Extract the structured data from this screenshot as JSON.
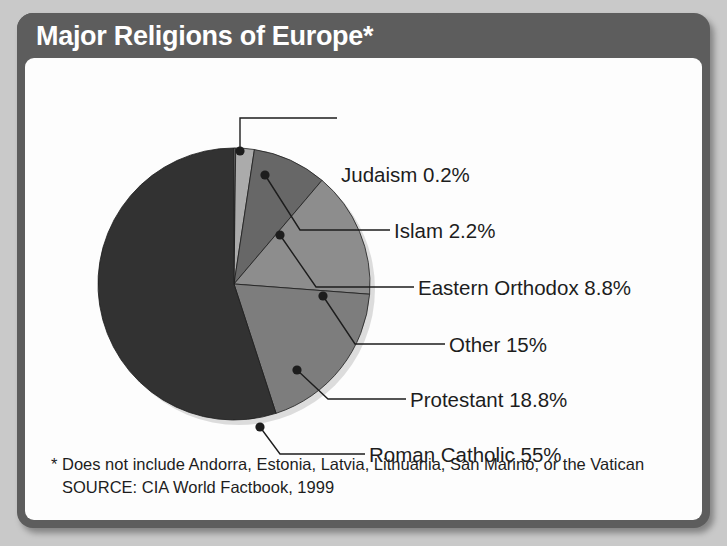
{
  "header": {
    "title": "Major Religions of Europe*"
  },
  "colors": {
    "frame": "#5d5d5d",
    "panel": "#fdfdfd",
    "page_background": "#c9c9c9",
    "title_text": "#ffffff",
    "label_text": "#1d1d1d",
    "leader_line": "#1d1d1d"
  },
  "chart_data": {
    "type": "pie",
    "title": "Major Religions of Europe*",
    "categories": [
      "Judaism",
      "Islam",
      "Eastern Orthodox",
      "Other",
      "Protestant",
      "Roman Catholic"
    ],
    "values": [
      0.2,
      2.2,
      8.8,
      15,
      18.8,
      55
    ],
    "unit": "%",
    "slice_colors": [
      "#d6d6d6",
      "#ababab",
      "#676767",
      "#8d8d8d",
      "#7d7d7d",
      "#323232"
    ],
    "legend": "callout-labels-right",
    "grid": false,
    "slices": [
      {
        "label": "Judaism 0.2%",
        "name": "Judaism",
        "value": 0.2,
        "color": "#d6d6d6"
      },
      {
        "label": "Islam 2.2%",
        "name": "Islam",
        "value": 2.2,
        "color": "#ababab"
      },
      {
        "label": "Eastern Orthodox 8.8%",
        "name": "Eastern Orthodox",
        "value": 8.8,
        "color": "#676767"
      },
      {
        "label": "Other 15%",
        "name": "Other",
        "value": 15,
        "color": "#8d8d8d"
      },
      {
        "label": "Protestant 18.8%",
        "name": "Protestant",
        "value": 18.8,
        "color": "#7d7d7d"
      },
      {
        "label": "Roman Catholic 55%",
        "name": "Roman Catholic",
        "value": 55,
        "color": "#323232"
      }
    ]
  },
  "footnotes": {
    "line1": "* Does not include Andorra, Estonia, Latvia, Lithuania, San Marino, or the Vatican",
    "line2": "SOURCE: CIA World Factbook, 1999"
  }
}
